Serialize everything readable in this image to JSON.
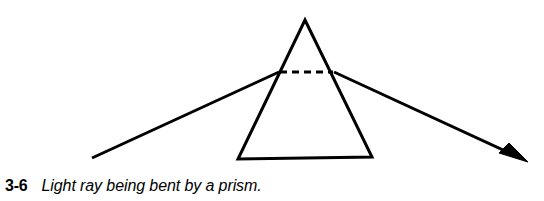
{
  "figure": {
    "caption_number": "3-6",
    "caption_text": "Light ray being bent by a prism.",
    "stroke_color": "#000000",
    "background_color": "#ffffff"
  },
  "diagram": {
    "title": "Light ray being bent by a prism",
    "type": "optics-ray-diagram",
    "stroke_width": 3,
    "prism": {
      "name": "triangular-prism",
      "shape": "triangle",
      "apex": [
        305,
        20
      ],
      "base_left": [
        238,
        159
      ],
      "base_right": [
        372,
        157
      ],
      "fill": "none",
      "stroke": "#000000",
      "stroke_width": 3
    },
    "incident_ray": {
      "name": "incident-ray",
      "from": [
        92,
        158
      ],
      "to": [
        278,
        72
      ],
      "stroke": "#000000",
      "stroke_width": 3,
      "dashed": false,
      "arrow": false
    },
    "internal_ray": {
      "name": "internal-ray",
      "from": [
        279,
        72
      ],
      "to": [
        333,
        72
      ],
      "stroke": "#000000",
      "stroke_width": 3,
      "dashed": true,
      "dash_pattern": "7 5",
      "arrow": false
    },
    "refracted_ray": {
      "name": "refracted-ray",
      "from": [
        334,
        72
      ],
      "to": [
        520,
        157
      ],
      "stroke": "#000000",
      "stroke_width": 3,
      "dashed": false,
      "arrow": true,
      "arrow_tip": [
        527,
        161
      ],
      "arrow_points": "527,161 500,152 508,144"
    }
  }
}
